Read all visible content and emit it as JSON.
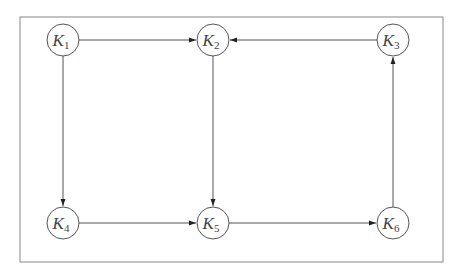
{
  "diagram": {
    "type": "directed-graph",
    "colors": {
      "stroke": "#555555",
      "frame": "#888888",
      "background": "#ffffff"
    },
    "nodes": [
      {
        "id": "K1",
        "letter": "K",
        "sub": "1"
      },
      {
        "id": "K2",
        "letter": "K",
        "sub": "2"
      },
      {
        "id": "K3",
        "letter": "K",
        "sub": "3"
      },
      {
        "id": "K4",
        "letter": "K",
        "sub": "4"
      },
      {
        "id": "K5",
        "letter": "K",
        "sub": "5"
      },
      {
        "id": "K6",
        "letter": "K",
        "sub": "6"
      }
    ],
    "edges": [
      {
        "from": "K1",
        "to": "K2"
      },
      {
        "from": "K3",
        "to": "K2"
      },
      {
        "from": "K1",
        "to": "K4"
      },
      {
        "from": "K2",
        "to": "K5"
      },
      {
        "from": "K4",
        "to": "K5"
      },
      {
        "from": "K5",
        "to": "K6"
      },
      {
        "from": "K6",
        "to": "K3"
      }
    ]
  }
}
